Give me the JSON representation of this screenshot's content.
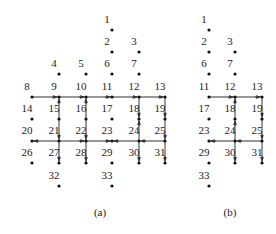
{
  "figure": {
    "panels": [
      {
        "id": "a",
        "caption": "(a)",
        "caption_pos": [
          100,
          216
        ],
        "nodes": [
          {
            "n": "1",
            "x": 112,
            "y": 30
          },
          {
            "n": "2",
            "x": 112,
            "y": 52
          },
          {
            "n": "3",
            "x": 139,
            "y": 52
          },
          {
            "n": "4",
            "x": 59,
            "y": 74
          },
          {
            "n": "5",
            "x": 86,
            "y": 74
          },
          {
            "n": "6",
            "x": 112,
            "y": 74
          },
          {
            "n": "7",
            "x": 139,
            "y": 74
          },
          {
            "n": "8",
            "x": 32,
            "y": 97
          },
          {
            "n": "9",
            "x": 59,
            "y": 97
          },
          {
            "n": "10",
            "x": 86,
            "y": 97
          },
          {
            "n": "11",
            "x": 112,
            "y": 97
          },
          {
            "n": "12",
            "x": 139,
            "y": 97
          },
          {
            "n": "13",
            "x": 165,
            "y": 97
          },
          {
            "n": "14",
            "x": 32,
            "y": 119
          },
          {
            "n": "15",
            "x": 59,
            "y": 119
          },
          {
            "n": "16",
            "x": 86,
            "y": 119
          },
          {
            "n": "17",
            "x": 112,
            "y": 119
          },
          {
            "n": "18",
            "x": 139,
            "y": 119
          },
          {
            "n": "19",
            "x": 165,
            "y": 119
          },
          {
            "n": "20",
            "x": 32,
            "y": 141
          },
          {
            "n": "21",
            "x": 59,
            "y": 141
          },
          {
            "n": "22",
            "x": 86,
            "y": 141
          },
          {
            "n": "23",
            "x": 112,
            "y": 141
          },
          {
            "n": "24",
            "x": 139,
            "y": 141
          },
          {
            "n": "25",
            "x": 165,
            "y": 141
          },
          {
            "n": "26",
            "x": 32,
            "y": 163
          },
          {
            "n": "27",
            "x": 59,
            "y": 163
          },
          {
            "n": "28",
            "x": 86,
            "y": 163
          },
          {
            "n": "29",
            "x": 112,
            "y": 163
          },
          {
            "n": "30",
            "x": 139,
            "y": 163
          },
          {
            "n": "31",
            "x": 165,
            "y": 163
          },
          {
            "n": "32",
            "x": 59,
            "y": 186
          },
          {
            "n": "33",
            "x": 112,
            "y": 186
          }
        ],
        "edges": [
          {
            "from": "8",
            "to": "9"
          },
          {
            "from": "9",
            "to": "10"
          },
          {
            "from": "10",
            "to": "11"
          },
          {
            "from": "11",
            "to": "12"
          },
          {
            "from": "12",
            "to": "13"
          },
          {
            "from": "15",
            "to": "9"
          },
          {
            "from": "15",
            "to": "21"
          },
          {
            "from": "16",
            "to": "10"
          },
          {
            "from": "16",
            "to": "22"
          },
          {
            "from": "12",
            "to": "18"
          },
          {
            "from": "24",
            "to": "18"
          },
          {
            "from": "13",
            "to": "19"
          },
          {
            "from": "19",
            "to": "25"
          },
          {
            "from": "21",
            "to": "20"
          },
          {
            "from": "21",
            "to": "22"
          },
          {
            "from": "22",
            "to": "23"
          },
          {
            "from": "24",
            "to": "23"
          },
          {
            "from": "25",
            "to": "24"
          },
          {
            "from": "21",
            "to": "27"
          },
          {
            "from": "22",
            "to": "28"
          },
          {
            "from": "24",
            "to": "30"
          },
          {
            "from": "25",
            "to": "31"
          }
        ]
      },
      {
        "id": "b",
        "caption": "(b)",
        "caption_pos": [
          230,
          216
        ],
        "nodes": [
          {
            "n": "1",
            "x": 209,
            "y": 30
          },
          {
            "n": "2",
            "x": 209,
            "y": 52
          },
          {
            "n": "3",
            "x": 235,
            "y": 52
          },
          {
            "n": "6",
            "x": 209,
            "y": 74
          },
          {
            "n": "7",
            "x": 235,
            "y": 74
          },
          {
            "n": "11",
            "x": 209,
            "y": 97
          },
          {
            "n": "12",
            "x": 235,
            "y": 97
          },
          {
            "n": "13",
            "x": 262,
            "y": 97
          },
          {
            "n": "17",
            "x": 209,
            "y": 119
          },
          {
            "n": "18",
            "x": 235,
            "y": 119
          },
          {
            "n": "19",
            "x": 262,
            "y": 119
          },
          {
            "n": "23",
            "x": 209,
            "y": 141
          },
          {
            "n": "24",
            "x": 235,
            "y": 141
          },
          {
            "n": "25",
            "x": 262,
            "y": 141
          },
          {
            "n": "29",
            "x": 209,
            "y": 163
          },
          {
            "n": "30",
            "x": 235,
            "y": 163
          },
          {
            "n": "31",
            "x": 262,
            "y": 163
          },
          {
            "n": "33",
            "x": 209,
            "y": 186
          }
        ],
        "edges": [
          {
            "from": "11",
            "to": "12"
          },
          {
            "from": "12",
            "to": "13"
          },
          {
            "from": "24",
            "to": "18"
          },
          {
            "from": "18",
            "to": "12"
          },
          {
            "from": "13",
            "to": "19"
          },
          {
            "from": "19",
            "to": "25"
          },
          {
            "from": "24",
            "to": "23"
          },
          {
            "from": "25",
            "to": "24"
          },
          {
            "from": "24",
            "to": "30"
          },
          {
            "from": "25",
            "to": "31"
          }
        ]
      }
    ]
  }
}
